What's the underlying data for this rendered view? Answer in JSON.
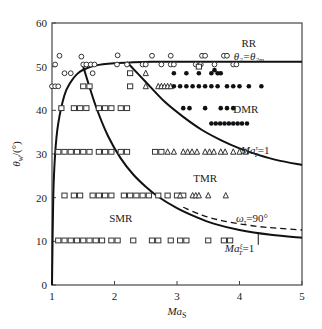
{
  "chart_data": {
    "type": "scatter",
    "title": "",
    "xlabel": "Ma_S",
    "ylabel": "θ_w/(°)",
    "xlim": [
      1,
      5
    ],
    "ylim": [
      0,
      60
    ],
    "xticks": [
      1,
      2,
      3,
      4,
      5
    ],
    "yticks": [
      0,
      10,
      20,
      30,
      40,
      50,
      60
    ],
    "grid": false,
    "region_labels": [
      {
        "text": "RR",
        "x": 4.15,
        "y": 54.5
      },
      {
        "text": "θ2=θ2m",
        "x": 4.15,
        "y": 51.5
      },
      {
        "text": "DMR",
        "x": 4.1,
        "y": 39.5
      },
      {
        "text": "TMR",
        "x": 3.45,
        "y": 23.5
      },
      {
        "text": "SMR",
        "x": 2.1,
        "y": 14.5
      }
    ],
    "curve_labels": [
      {
        "text": "Ma_T^τ=1",
        "x": 4.25,
        "y": 30
      },
      {
        "text": "ω_τ=90°",
        "x": 4.2,
        "y": 14.5
      },
      {
        "text": "Ma_T^ξ=1",
        "x": 4.0,
        "y": 7.5
      }
    ],
    "curves": [
      {
        "name": "θ2=θ2m (RR boundary)",
        "style": "solid",
        "x": [
          1.0,
          1.02,
          1.05,
          1.1,
          1.2,
          1.3,
          1.4,
          1.5,
          1.7,
          2.0,
          2.3,
          2.6,
          3.0,
          3.5,
          4.0,
          4.5,
          5.0
        ],
        "y": [
          0,
          20,
          30,
          37,
          43.5,
          46.5,
          48.3,
          49.3,
          50.3,
          50.8,
          51.0,
          51.1,
          51.1,
          51.1,
          51.1,
          51.1,
          51.1
        ]
      },
      {
        "name": "Ma_T^τ=1 (DMR/TMR)",
        "style": "solid",
        "x": [
          2.2,
          2.5,
          2.8,
          3.1,
          3.4,
          3.7,
          4.0,
          4.3,
          4.6,
          5.0
        ],
        "y": [
          51.0,
          46.5,
          42.0,
          38.5,
          35.5,
          33.2,
          31.3,
          29.8,
          28.6,
          27.5
        ]
      },
      {
        "name": "ω_τ=90°",
        "style": "dashed",
        "x": [
          3.1,
          3.4,
          3.7,
          4.0,
          4.3,
          4.6,
          5.0
        ],
        "y": [
          17.8,
          16.0,
          14.8,
          14.0,
          13.4,
          13.0,
          12.6
        ]
      },
      {
        "name": "Ma_T^ξ=1 (TMR/SMR)",
        "style": "solid",
        "x": [
          1.5,
          1.7,
          1.9,
          2.1,
          2.3,
          2.5,
          2.7,
          3.0,
          3.3,
          3.6,
          4.0,
          4.5,
          5.0
        ],
        "y": [
          50.0,
          41.0,
          34.0,
          29.0,
          25.3,
          22.5,
          20.2,
          17.6,
          15.6,
          14.0,
          12.6,
          11.5,
          10.8
        ]
      }
    ],
    "series": [
      {
        "name": "RR (open circle)",
        "marker": "circle",
        "points": [
          [
            1.12,
            52.5
          ],
          [
            1.47,
            52.3
          ],
          [
            2.05,
            52.6
          ],
          [
            2.6,
            52.5
          ],
          [
            2.9,
            52.5
          ],
          [
            3.4,
            52.5
          ],
          [
            3.45,
            52.5
          ],
          [
            3.75,
            52.5
          ],
          [
            3.8,
            52.5
          ],
          [
            1.05,
            50.5
          ],
          [
            1.5,
            50.5
          ],
          [
            1.55,
            50.5
          ],
          [
            1.62,
            50.5
          ],
          [
            1.68,
            50.5
          ],
          [
            2.04,
            50.5
          ],
          [
            2.2,
            50.5
          ],
          [
            2.45,
            50.5
          ],
          [
            2.5,
            50.5
          ],
          [
            2.75,
            50.5
          ],
          [
            2.9,
            50.5
          ],
          [
            2.95,
            50.5
          ],
          [
            3.3,
            50.5
          ],
          [
            3.38,
            50.5
          ],
          [
            3.6,
            50.5
          ],
          [
            3.9,
            50.5
          ],
          [
            3.95,
            50.5
          ],
          [
            1.2,
            48.5
          ],
          [
            1.3,
            48.5
          ],
          [
            1.65,
            48.5
          ],
          [
            1.0,
            45.5
          ],
          [
            1.05,
            45.5
          ],
          [
            1.1,
            45.5
          ]
        ]
      },
      {
        "name": "SMR (open square)",
        "marker": "square",
        "points": [
          [
            2.25,
            48.5
          ],
          [
            3.35,
            50.0
          ],
          [
            1.5,
            45.5
          ],
          [
            1.6,
            45.5
          ],
          [
            2.25,
            45.5
          ],
          [
            1.15,
            40.5
          ],
          [
            1.35,
            40.5
          ],
          [
            1.45,
            40.5
          ],
          [
            1.55,
            40.5
          ],
          [
            1.75,
            40.5
          ],
          [
            1.85,
            40.5
          ],
          [
            1.95,
            40.5
          ],
          [
            2.1,
            40.5
          ],
          [
            2.2,
            40.5
          ],
          [
            1.1,
            30.5
          ],
          [
            1.2,
            30.5
          ],
          [
            1.3,
            30.5
          ],
          [
            1.4,
            30.5
          ],
          [
            1.5,
            30.5
          ],
          [
            1.6,
            30.5
          ],
          [
            1.75,
            30.5
          ],
          [
            1.85,
            30.5
          ],
          [
            1.95,
            30.5
          ],
          [
            2.1,
            30.5
          ],
          [
            2.2,
            30.5
          ],
          [
            2.65,
            30.5
          ],
          [
            2.75,
            30.5
          ],
          [
            1.2,
            20.5
          ],
          [
            1.35,
            20.5
          ],
          [
            1.45,
            20.5
          ],
          [
            1.65,
            20.5
          ],
          [
            1.75,
            20.5
          ],
          [
            1.85,
            20.5
          ],
          [
            1.95,
            20.5
          ],
          [
            2.15,
            20.5
          ],
          [
            2.25,
            20.5
          ],
          [
            2.35,
            20.5
          ],
          [
            2.45,
            20.5
          ],
          [
            2.55,
            20.5
          ],
          [
            2.7,
            20.5
          ],
          [
            2.85,
            20.5
          ],
          [
            3.0,
            20.5
          ],
          [
            3.1,
            20.5
          ],
          [
            1.1,
            10.2
          ],
          [
            1.2,
            10.2
          ],
          [
            1.3,
            10.2
          ],
          [
            1.4,
            10.2
          ],
          [
            1.5,
            10.2
          ],
          [
            1.6,
            10.2
          ],
          [
            1.7,
            10.2
          ],
          [
            1.8,
            10.2
          ],
          [
            1.95,
            10.2
          ],
          [
            2.05,
            10.2
          ],
          [
            2.3,
            10.2
          ],
          [
            2.6,
            10.2
          ],
          [
            2.7,
            10.2
          ],
          [
            2.9,
            10.2
          ],
          [
            3.05,
            10.2
          ],
          [
            3.15,
            10.2
          ],
          [
            3.5,
            10.2
          ],
          [
            3.75,
            10.2
          ],
          [
            3.85,
            10.2
          ]
        ]
      },
      {
        "name": "TMR (open triangle)",
        "marker": "triangle",
        "points": [
          [
            2.5,
            48.5
          ],
          [
            2.5,
            45.5
          ],
          [
            2.7,
            45.5
          ],
          [
            2.75,
            45.5
          ],
          [
            2.8,
            45.5
          ],
          [
            2.85,
            45.5
          ],
          [
            2.9,
            45.5
          ],
          [
            2.85,
            30.5
          ],
          [
            2.95,
            30.5
          ],
          [
            3.1,
            30.5
          ],
          [
            3.17,
            30.5
          ],
          [
            3.24,
            30.5
          ],
          [
            3.32,
            30.5
          ],
          [
            3.45,
            30.5
          ],
          [
            3.52,
            30.5
          ],
          [
            3.59,
            30.5
          ],
          [
            3.7,
            30.5
          ],
          [
            3.77,
            30.5
          ],
          [
            3.9,
            30.5
          ],
          [
            4.0,
            30.5
          ],
          [
            4.1,
            30.5
          ],
          [
            3.05,
            20.5
          ],
          [
            3.25,
            20.5
          ],
          [
            3.3,
            20.5
          ],
          [
            3.35,
            20.5
          ],
          [
            3.5,
            20.5
          ],
          [
            3.78,
            20.5
          ]
        ]
      },
      {
        "name": "DMR (filled circle)",
        "marker": "dot",
        "points": [
          [
            2.95,
            48.5
          ],
          [
            3.15,
            48.5
          ],
          [
            3.35,
            48.5
          ],
          [
            3.6,
            49.2
          ],
          [
            3.65,
            48.5
          ],
          [
            3.7,
            48.5
          ],
          [
            3.55,
            48.5
          ],
          [
            2.95,
            45.5
          ],
          [
            3.05,
            45.5
          ],
          [
            3.15,
            45.5
          ],
          [
            3.25,
            45.5
          ],
          [
            3.35,
            45.5
          ],
          [
            3.45,
            45.5
          ],
          [
            3.55,
            45.5
          ],
          [
            3.65,
            45.5
          ],
          [
            3.8,
            45.5
          ],
          [
            3.9,
            45.5
          ],
          [
            4.0,
            45.5
          ],
          [
            4.15,
            45.5
          ],
          [
            4.35,
            45.5
          ],
          [
            3.1,
            40.5
          ],
          [
            3.2,
            40.5
          ],
          [
            3.45,
            40.5
          ],
          [
            3.7,
            40.5
          ],
          [
            3.8,
            40.5
          ],
          [
            3.9,
            40.5
          ],
          [
            3.55,
            37.0
          ],
          [
            3.62,
            37.0
          ],
          [
            3.69,
            37.0
          ],
          [
            3.76,
            37.0
          ],
          [
            3.83,
            37.0
          ],
          [
            3.9,
            37.0
          ],
          [
            3.97,
            37.0
          ],
          [
            4.04,
            37.0
          ],
          [
            4.12,
            37.0
          ]
        ]
      }
    ]
  },
  "labels": {
    "x_axis": "Ma",
    "x_axis_sub": "S",
    "y_axis": "θ",
    "y_axis_sub": "w",
    "y_axis_unit": "/(°)"
  }
}
